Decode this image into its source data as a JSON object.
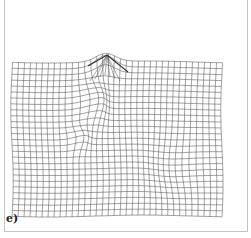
{
  "figure": {
    "panel_label": "e)",
    "line_color": "#555555",
    "frame_color": "#c4c4c4"
  },
  "grid": {
    "columns": 35,
    "rows": 26,
    "x_min": 12,
    "x_max": 222,
    "y_min": 62,
    "y_max": 216,
    "peak": {
      "x": 107,
      "y": 55
    },
    "deformations": [
      {
        "cx": 105,
        "cy": 68,
        "sx": 14,
        "sy": 10,
        "dx": 0,
        "dy": -12
      },
      {
        "cx": 92,
        "cy": 105,
        "sx": 14,
        "sy": 22,
        "dx": 10,
        "dy": -6
      },
      {
        "cx": 78,
        "cy": 140,
        "sx": 10,
        "sy": 12,
        "dx": 6,
        "dy": -4
      },
      {
        "cx": 175,
        "cy": 165,
        "sx": 26,
        "sy": 30,
        "dx": -6,
        "dy": 3
      }
    ]
  }
}
